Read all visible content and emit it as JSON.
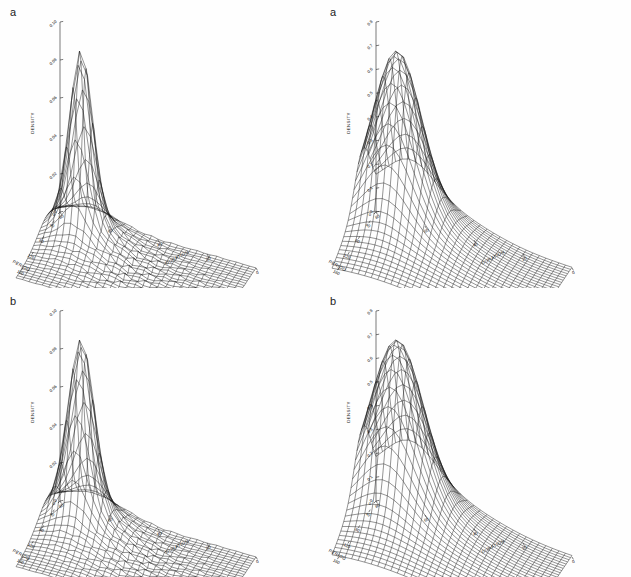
{
  "figure": {
    "background": "#ffffff",
    "ink": "#111111",
    "layout": "2x2 grid of 3D wireframe surface plots"
  },
  "panels": [
    {
      "id": "top-left",
      "label": "a",
      "zlabel": "DENSITY",
      "xlabel": "DURATION",
      "ylabel": "PERIOD",
      "zticks": [
        "0.10",
        "0.08",
        "0.06",
        "0.04",
        "0.02",
        "0"
      ],
      "xticks": [
        "0",
        "20",
        "40",
        "60",
        "80"
      ],
      "yticks": [
        "40",
        "80",
        "120",
        "160"
      ]
    },
    {
      "id": "top-right",
      "label": "a",
      "zlabel": "DENSITY",
      "xlabel": "DURATION",
      "ylabel": "PERIOD",
      "zticks": [
        "0.8",
        "0.7",
        "0.6",
        "0.5",
        "0.4",
        "0.3",
        "0.2",
        "0.1",
        "0"
      ],
      "xticks": [
        "0",
        "20",
        "40",
        "60",
        "80"
      ],
      "yticks": [
        "40",
        "80",
        "120",
        "160"
      ]
    },
    {
      "id": "bottom-left",
      "label": "b",
      "zlabel": "DENSITY",
      "xlabel": "DURATION",
      "ylabel": "PERIOD",
      "zticks": [
        "0.10",
        "0.08",
        "0.06",
        "0.04",
        "0.02",
        "0"
      ],
      "xticks": [
        "0",
        "20",
        "40",
        "60",
        "80"
      ],
      "yticks": [
        "40",
        "80",
        "120",
        "160"
      ]
    },
    {
      "id": "bottom-right",
      "label": "b",
      "zlabel": "DENSITY",
      "xlabel": "DURATION",
      "ylabel": "PERIOD",
      "zticks": [
        "0.8",
        "0.7",
        "0.6",
        "0.5",
        "0.4",
        "0.3",
        "0.2",
        "0.1",
        "0"
      ],
      "xticks": [
        "0",
        "20",
        "40",
        "60",
        "80"
      ],
      "yticks": [
        "40",
        "80",
        "120",
        "160"
      ]
    }
  ],
  "chart_data": [
    {
      "type": "surface",
      "panel": "top-left",
      "title": "a",
      "xlabel": "DURATION",
      "ylabel": "PERIOD",
      "zlabel": "DENSITY",
      "xlim": [
        0,
        90
      ],
      "ylim": [
        0,
        180
      ],
      "zlim": [
        0,
        0.1
      ],
      "grid": 30,
      "peak": {
        "x": 15,
        "y": 30,
        "z": 0.105,
        "shape": "narrow-sharp-spike",
        "sigma_x": 5,
        "sigma_y": 9
      },
      "description": "Bivariate kernel density estimate with a very tall, narrow spike near low DURATION and low PERIOD; surface is near zero elsewhere with slight bumpy texture."
    },
    {
      "type": "surface",
      "panel": "top-right",
      "title": "a",
      "xlabel": "DURATION",
      "ylabel": "PERIOD",
      "zlabel": "DENSITY",
      "xlim": [
        0,
        90
      ],
      "ylim": [
        0,
        180
      ],
      "zlim": [
        0,
        0.8
      ],
      "grid": 30,
      "peak": {
        "x": 15,
        "y": 30,
        "z": 0.82,
        "shape": "smooth-bell",
        "sigma_x": 9,
        "sigma_y": 15
      },
      "description": "Smoothed bivariate density estimate, single broad unimodal bell peak with gradual tails spreading over the DURATION-PERIOD plane."
    },
    {
      "type": "surface",
      "panel": "bottom-left",
      "title": "b",
      "xlabel": "DURATION",
      "ylabel": "PERIOD",
      "zlabel": "DENSITY",
      "xlim": [
        0,
        90
      ],
      "ylim": [
        0,
        180
      ],
      "zlim": [
        0,
        0.1
      ],
      "grid": 30,
      "peak": {
        "x": 15,
        "y": 30,
        "z": 0.103,
        "shape": "narrow-sharp-spike",
        "sigma_x": 5.5,
        "sigma_y": 10
      },
      "description": "Bivariate kernel density estimate with a tall narrow spike, slightly broader base than panel a, flat textured surface elsewhere."
    },
    {
      "type": "surface",
      "panel": "bottom-right",
      "title": "b",
      "xlabel": "DURATION",
      "ylabel": "PERIOD",
      "zlabel": "DENSITY",
      "xlim": [
        0,
        90
      ],
      "ylim": [
        0,
        180
      ],
      "zlim": [
        0,
        0.8
      ],
      "grid": 30,
      "peak": {
        "x": 15,
        "y": 30,
        "z": 0.8,
        "shape": "smooth-bell",
        "sigma_x": 10,
        "sigma_y": 16
      },
      "description": "Smoothed bivariate density estimate, broad unimodal bell-shaped peak with long gradual tails."
    }
  ]
}
